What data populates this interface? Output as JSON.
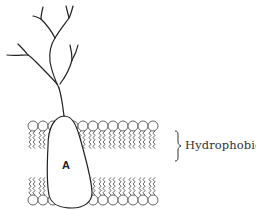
{
  "diagram": {
    "protein_label": "A",
    "region_label": "Hydrophobic",
    "colors": {
      "stroke": "#222222",
      "lipid": "#555555",
      "text": "#333333",
      "background": "#ffffff"
    },
    "bilayer": {
      "head_rows": [
        "top",
        "bottom"
      ],
      "top_head_y": 126,
      "bottom_head_y": 200,
      "head_diameter": 10,
      "x_start": 28,
      "x_end": 150
    },
    "elements": [
      {
        "name": "branched-chain",
        "type": "branched glycan/oligosaccharide"
      },
      {
        "name": "protein-a",
        "type": "membrane protein"
      },
      {
        "name": "lipid-bilayer",
        "type": "phospholipid bilayer"
      },
      {
        "name": "hydrophobic-brace",
        "type": "brace annotation"
      }
    ]
  }
}
